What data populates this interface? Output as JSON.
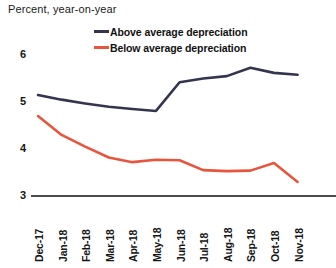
{
  "chart_data": {
    "type": "line",
    "title": "Percent, year-on-year",
    "xlabel": "",
    "ylabel": "",
    "ylim": [
      3,
      6.2
    ],
    "yticks": [
      3,
      4,
      5,
      6
    ],
    "ytick_labels": [
      "3",
      "4",
      "5",
      "6"
    ],
    "grid": false,
    "legend_position": "top-center",
    "categories": [
      "Dec-17",
      "Jan-18",
      "Feb-18",
      "Mar-18",
      "Apr-18",
      "May-18",
      "Jun-18",
      "Jul-18",
      "Aug-18",
      "Sep-18",
      "Oct-18",
      "Nov-18"
    ],
    "series": [
      {
        "name": "Above average depreciation",
        "color": "#343451",
        "values": [
          5.15,
          5.05,
          4.97,
          4.9,
          4.85,
          4.81,
          5.42,
          5.5,
          5.55,
          5.73,
          5.62,
          5.58
        ]
      },
      {
        "name": "Below average depreciation",
        "color": "#E8553C",
        "values": [
          4.7,
          4.3,
          4.05,
          3.82,
          3.72,
          3.77,
          3.76,
          3.55,
          3.53,
          3.54,
          3.7,
          3.3
        ]
      }
    ]
  },
  "legend": {
    "items": [
      {
        "label": "Above average depreciation",
        "color": "#343451"
      },
      {
        "label": "Below average depreciation",
        "color": "#E8553C"
      }
    ]
  },
  "axes": {
    "axis_line_color": "#4a4a4a"
  }
}
